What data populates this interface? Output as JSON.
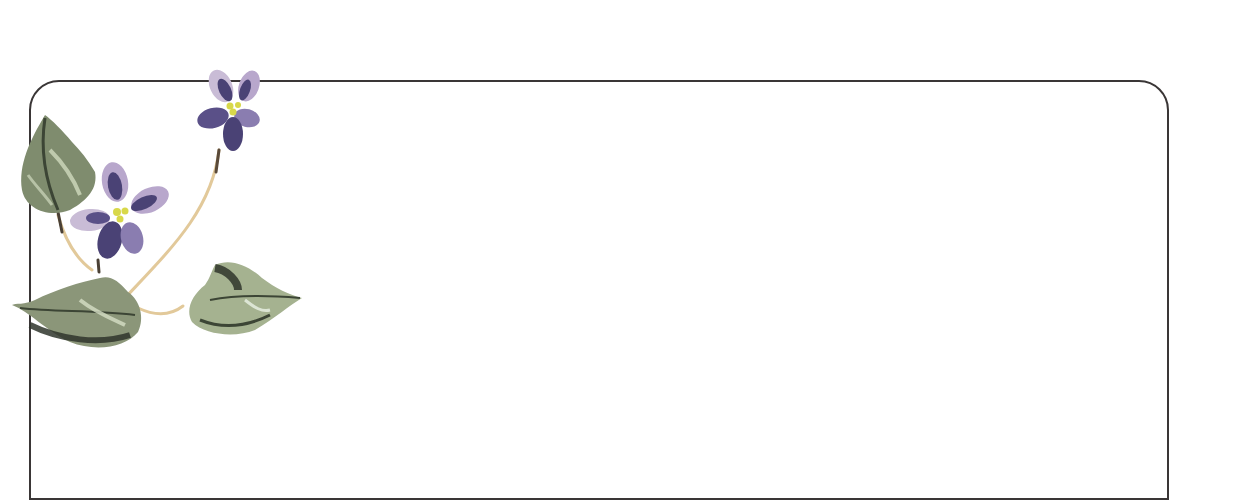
{
  "card": {
    "type": "stationery-frame",
    "border_color": "#3a3636",
    "background": "#ffffff"
  },
  "decoration": {
    "subject": "violets",
    "elements": [
      "violet-flower-top",
      "violet-flower-middle",
      "leaf-upper-left",
      "leaf-lower-left",
      "leaf-lower-right",
      "stems"
    ],
    "colors": {
      "petal_dark": "#4a4275",
      "petal_light": "#c9bcd6",
      "center": "#d8d84a",
      "leaf_dark": "#3c4535",
      "leaf_mid": "#7f8c6e",
      "leaf_light": "#cfd9bd",
      "stem": "#e2c99a"
    }
  }
}
